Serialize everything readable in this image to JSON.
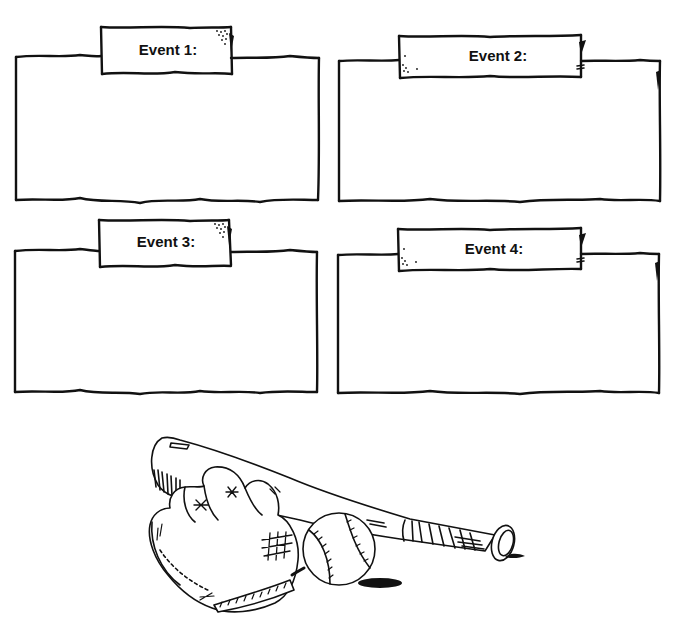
{
  "worksheet": {
    "events": [
      {
        "label": "Event 1:"
      },
      {
        "label": "Event 2:"
      },
      {
        "label": "Event 3:"
      },
      {
        "label": "Event 4:"
      }
    ],
    "illustration": {
      "subject": "baseball bat, glove and ball",
      "ink_color": "#111111",
      "paper_color": "#ffffff"
    }
  }
}
